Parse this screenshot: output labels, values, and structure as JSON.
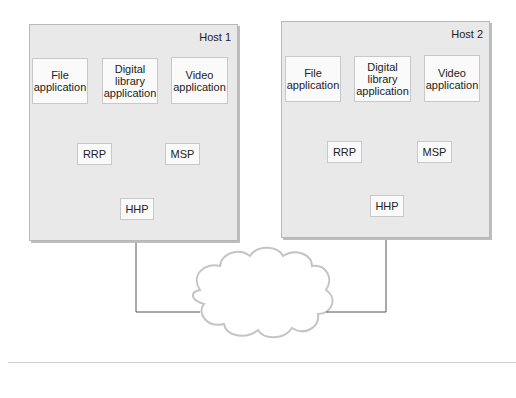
{
  "hosts": [
    {
      "label": "Host 1",
      "apps": [
        "File application",
        "Digital library application",
        "Video application"
      ],
      "protocols": {
        "rrp": "RRP",
        "msp": "MSP",
        "hhp": "HHP"
      }
    },
    {
      "label": "Host 2",
      "apps": [
        "File application",
        "Digital library application",
        "Video application"
      ],
      "protocols": {
        "rrp": "RRP",
        "msp": "MSP",
        "hhp": "HHP"
      }
    }
  ],
  "network": {
    "shape": "cloud"
  }
}
